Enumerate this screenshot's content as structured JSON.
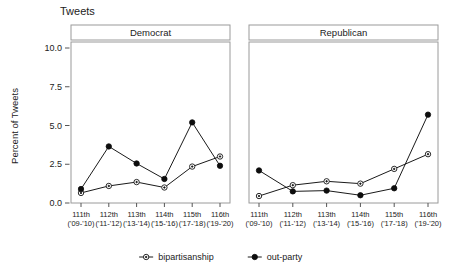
{
  "chart_data": {
    "type": "line",
    "title": "Tweets",
    "xlabel": "",
    "ylabel": "Percent of Tweets",
    "ylim": [
      0,
      10
    ],
    "yticks": [
      "0.0",
      "2.5",
      "5.0",
      "7.5",
      "10.0"
    ],
    "ytick_values": [
      0,
      2.5,
      5,
      7.5,
      10
    ],
    "grid": false,
    "legend_position": "bottom",
    "categories": [
      "111th",
      "112th",
      "113th",
      "114th",
      "115th",
      "116th"
    ],
    "category_sublabels": [
      "('09-'10)",
      "('11-'12)",
      "('13-'14)",
      "('15-'16)",
      "('17-'18)",
      "('19-'20)"
    ],
    "panels": [
      {
        "label": "Democrat",
        "series": [
          {
            "name": "bipartisanship",
            "marker": "open-circle",
            "values": [
              0.65,
              1.1,
              1.35,
              1.0,
              2.35,
              3.0
            ]
          },
          {
            "name": "out-party",
            "marker": "filled-circle",
            "values": [
              0.9,
              3.65,
              2.55,
              1.55,
              5.2,
              2.4
            ]
          }
        ]
      },
      {
        "label": "Republican",
        "series": [
          {
            "name": "bipartisanship",
            "marker": "open-circle",
            "values": [
              0.45,
              1.15,
              1.4,
              1.25,
              2.2,
              3.15
            ]
          },
          {
            "name": "out-party",
            "marker": "filled-circle",
            "values": [
              2.1,
              0.75,
              0.8,
              0.5,
              0.95,
              5.7
            ]
          }
        ]
      }
    ],
    "legend": [
      {
        "label": "bipartisanship",
        "marker": "open-circle"
      },
      {
        "label": "out-party",
        "marker": "filled-circle"
      }
    ]
  },
  "colors": {
    "line": "#1a1a1a",
    "filled_marker": "#0d0d0d",
    "open_marker_fill": "#ffffff",
    "panel_border": "#9a9a9a",
    "background": "#ffffff",
    "text": "#222222"
  }
}
